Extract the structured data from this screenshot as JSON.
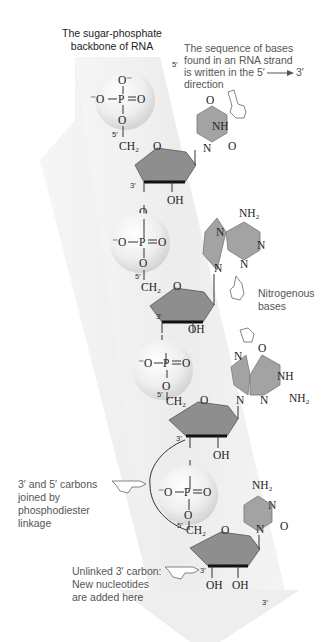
{
  "title": {
    "line1": "The sugar-phosphate",
    "line2": "backbone of RNA"
  },
  "direction_note": {
    "five_prime": "5′",
    "line1": "The sequence of bases",
    "line2": "found in an RNA strand",
    "line3": "is written in the 5′",
    "line3_end": "3′",
    "line4": "direction"
  },
  "labels": {
    "nitrogenous_bases": [
      "Nitrogenous",
      "bases"
    ],
    "phosphodiester": [
      "3′ and 5′ carbons",
      "joined by",
      "phosphodiester",
      "linkage"
    ],
    "unlinked": [
      "Unlinked 3′ carbon:",
      "New nucleotides",
      "are added here"
    ],
    "three_prime_end": "3′"
  },
  "chem": {
    "o_minus": "O⁻",
    "minus_o": "⁻O",
    "p": "P",
    "o": "O",
    "ch2": "CH₂",
    "oh": "OH",
    "nh": "NH",
    "nh2": "NH₂",
    "n": "N",
    "five": "5′",
    "three": "3′"
  },
  "nucleotides": [
    {
      "base": "uracil"
    },
    {
      "base": "adenine"
    },
    {
      "base": "guanine"
    },
    {
      "base": "cytosine"
    }
  ],
  "colors": {
    "band": "#efefef",
    "sphere": "#e6e6e6",
    "sugar": "#8e8e8e",
    "base": "#a3a3a3",
    "label_text": "#555555"
  }
}
